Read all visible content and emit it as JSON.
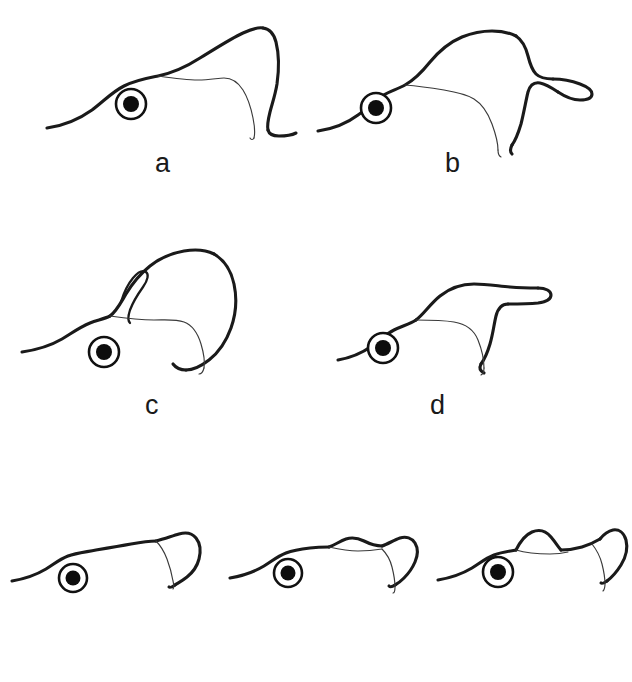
{
  "figure": {
    "background_color": "#ffffff",
    "ink_color": "#1a1a1a",
    "width": 632,
    "height": 682,
    "panel_count": 7,
    "rows": 3
  },
  "panels": [
    {
      "id": "a",
      "label": "a",
      "row": 1,
      "column": 1,
      "label_x": 155,
      "label_y": 150,
      "drawing_x": 30,
      "drawing_y": 12,
      "drawing_width": 280,
      "drawing_height": 130,
      "description": "lateral outline with tall pointed dorsal crest and eye ring",
      "eye": {
        "cx": 131,
        "cy": 104,
        "outer_r": 15,
        "inner_r": 8
      }
    },
    {
      "id": "b",
      "label": "b",
      "row": 1,
      "column": 2,
      "label_x": 445,
      "label_y": 150,
      "drawing_x": 320,
      "drawing_y": 12,
      "drawing_width": 280,
      "drawing_height": 130,
      "description": "lateral outline with rounded dorsal hump and posterior lobe",
      "eye": {
        "cx": 376,
        "cy": 108,
        "outer_r": 15,
        "inner_r": 8
      }
    },
    {
      "id": "c",
      "label": "c",
      "row": 2,
      "column": 1,
      "label_x": 145,
      "label_y": 392,
      "drawing_x": 20,
      "drawing_y": 255,
      "drawing_width": 290,
      "drawing_height": 130,
      "description": "lateral outline with large rounded dorsal dome and narrow anterior hook loop",
      "eye": {
        "cx": 104,
        "cy": 352,
        "outer_r": 15,
        "inner_r": 8
      }
    },
    {
      "id": "d",
      "label": "d",
      "row": 2,
      "column": 2,
      "label_x": 430,
      "label_y": 392,
      "drawing_x": 340,
      "drawing_y": 280,
      "drawing_width": 250,
      "drawing_height": 110,
      "description": "lateral outline with low elongated dorsal projection pointing posteriorly",
      "eye": {
        "cx": 383,
        "cy": 348,
        "outer_r": 15,
        "inner_r": 8
      }
    },
    {
      "id": "e",
      "label": "e",
      "row": 3,
      "column": 1,
      "label_x": 85,
      "label_y": 620,
      "drawing_x": 10,
      "drawing_y": 525,
      "drawing_width": 200,
      "drawing_height": 85,
      "description": "small lateral outline with single posterior loop, smooth dorsal margin",
      "eye": {
        "cx": 73,
        "cy": 578,
        "outer_r": 14,
        "inner_r": 7
      }
    },
    {
      "id": "f",
      "label": "f",
      "row": 3,
      "column": 2,
      "label_x": 310,
      "label_y": 620,
      "drawing_x": 225,
      "drawing_y": 525,
      "drawing_width": 200,
      "drawing_height": 85,
      "description": "small lateral outline with faint low dorsal swelling and posterior loop",
      "eye": {
        "cx": 288,
        "cy": 573,
        "outer_r": 14,
        "inner_r": 7
      }
    },
    {
      "id": "g",
      "label": "g",
      "row": 3,
      "column": 3,
      "label_x": 525,
      "label_y": 620,
      "drawing_x": 440,
      "drawing_y": 520,
      "drawing_width": 192,
      "drawing_height": 90,
      "description": "small lateral outline with distinct rounded dorsal bump plus larger posterior loop",
      "eye": {
        "cx": 498,
        "cy": 572,
        "outer_r": 15,
        "inner_r": 8
      }
    }
  ]
}
